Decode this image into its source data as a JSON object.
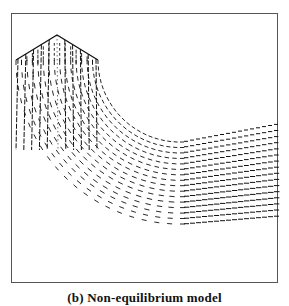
{
  "figure": {
    "caption": "(b) Non-equilibrium model",
    "frame_color": "#555555",
    "vector_color": "#111111"
  },
  "chart_data": {
    "type": "vector-field",
    "title": "(b) Non-equilibrium model",
    "geometry": {
      "inlet_peak_px": [
        57,
        35
      ],
      "inlet_left_shoulder_px": [
        16,
        60
      ],
      "inlet_right_shoulder_px": [
        98,
        60
      ],
      "outlet_right_edge_px": {
        "x": 277,
        "top_y": 184,
        "bottom_y": 257
      }
    },
    "xlabel": "",
    "ylabel": "",
    "grid": false
  }
}
